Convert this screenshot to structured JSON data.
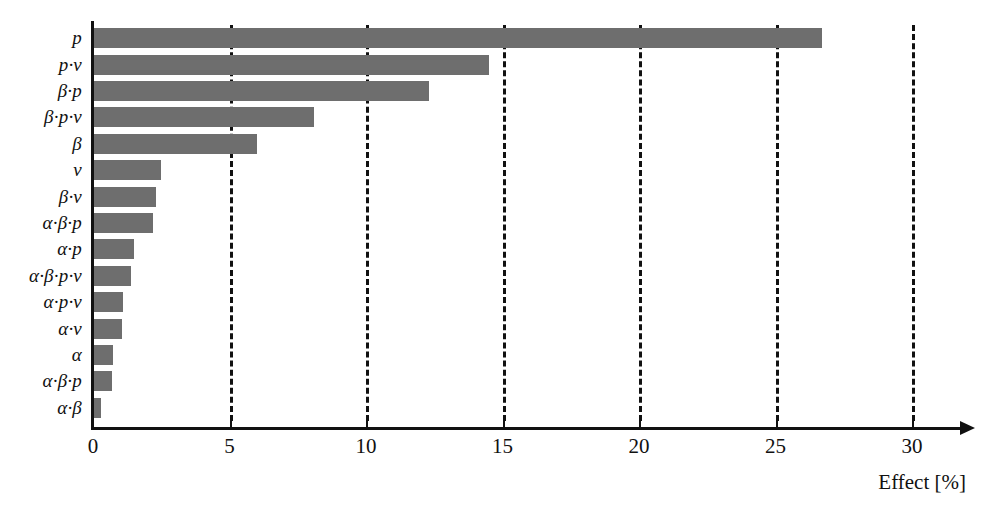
{
  "chart_data": {
    "type": "bar",
    "orientation": "horizontal",
    "title": "",
    "subtitle": "",
    "xlabel": "Effect [%]",
    "ylabel": "",
    "xlim": [
      0,
      31.5
    ],
    "xticks": [
      0,
      5,
      10,
      15,
      20,
      25,
      30
    ],
    "xtick_labels": [
      "0",
      "5",
      "10",
      "15",
      "20",
      "25",
      "30"
    ],
    "grid": "vertical-dashed",
    "legend": "none",
    "bar_color": "#6e6e6e",
    "axis_color": "#111111",
    "categories": [
      "p",
      "p·ν",
      "β·p",
      "β·p·ν",
      "β",
      "ν",
      "β·ν",
      "α·β·p",
      "α·p",
      "α·β·p·ν",
      "α·p·ν",
      "α·ν",
      "α",
      "α·β·p",
      "α·β"
    ],
    "values": [
      26.7,
      14.5,
      12.3,
      8.1,
      6.0,
      2.5,
      2.3,
      2.2,
      1.5,
      1.4,
      1.1,
      1.05,
      0.75,
      0.7,
      0.3
    ],
    "annotations": []
  }
}
